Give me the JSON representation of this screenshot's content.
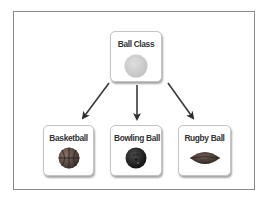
{
  "diagram": {
    "root": {
      "label": "Ball Class",
      "icon": "generic-ball-icon",
      "icon_color": "#cfcfcf"
    },
    "children": [
      {
        "label": "Basketball",
        "icon": "basketball-icon",
        "icon_color": "#5a4a44"
      },
      {
        "label": "Bowling Ball",
        "icon": "bowling-ball-icon",
        "icon_color": "#1e1e1e"
      },
      {
        "label": "Rugby Ball",
        "icon": "rugby-ball-icon",
        "icon_color": "#4a3a36"
      }
    ],
    "edges": [
      {
        "from": "Ball Class",
        "to": "Basketball"
      },
      {
        "from": "Ball Class",
        "to": "Bowling Ball"
      },
      {
        "from": "Ball Class",
        "to": "Rugby Ball"
      }
    ],
    "colors": {
      "frame_border": "#8a8a8a",
      "node_border": "#c4c4c4",
      "arrow": "#3a3a3a",
      "text": "#333333"
    }
  }
}
